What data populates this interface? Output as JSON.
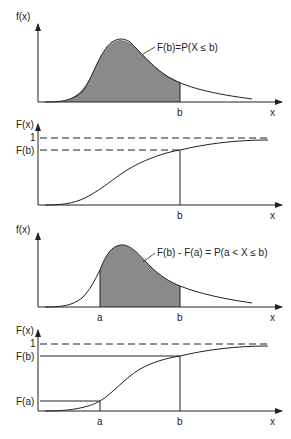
{
  "figure": {
    "panels": [
      {
        "id": "pdf-cumulative",
        "y_label": "f(x)",
        "x_label": "x",
        "tick_b": "b",
        "annotation": "F(b)=P(X ≤ b)"
      },
      {
        "id": "cdf-b",
        "y_label": "F(x)",
        "x_label": "x",
        "tick_b": "b",
        "level_one": "1",
        "level_fb": "F(b)"
      },
      {
        "id": "pdf-interval",
        "y_label": "f(x)",
        "x_label": "x",
        "tick_a": "a",
        "tick_b": "b",
        "annotation": "F(b) - F(a) = P(a < X ≤ b)"
      },
      {
        "id": "cdf-interval",
        "y_label": "F(x)",
        "x_label": "x",
        "tick_a": "a",
        "tick_b": "b",
        "level_one": "1",
        "level_fb": "F(b)",
        "level_fa": "F(a)"
      }
    ],
    "colors": {
      "line": "#222222",
      "shade": "#8a8a8a",
      "background": "#ffffff"
    }
  }
}
